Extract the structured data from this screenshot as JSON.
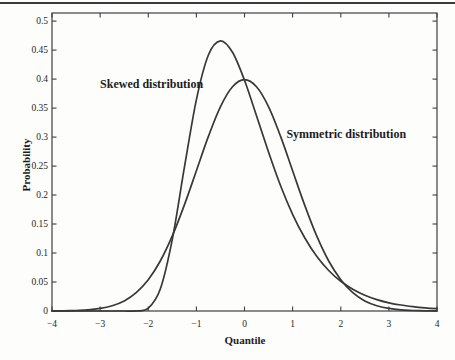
{
  "chart_data": {
    "type": "line",
    "title": "",
    "xlabel": "Quantile",
    "ylabel": "Probability",
    "xlim": [
      -4,
      4
    ],
    "ylim": [
      0,
      0.514
    ],
    "grid": false,
    "legend_position": "none",
    "x_ticks": [
      -4,
      -3,
      -2,
      -1,
      0,
      1,
      2,
      3,
      4
    ],
    "x_tick_labels": [
      "−4",
      "−3",
      "−2",
      "−1",
      "0",
      "1",
      "2",
      "3",
      "4"
    ],
    "y_ticks": [
      0,
      0.05,
      0.1,
      0.15,
      0.2,
      0.25,
      0.3,
      0.35,
      0.4,
      0.45,
      0.5
    ],
    "y_tick_labels": [
      "0",
      "0.05",
      "0.1",
      "0.15",
      "0.2",
      "0.25",
      "0.3",
      "0.35",
      "0.4",
      "0.45",
      "0.5"
    ],
    "x": [
      -4,
      -3.75,
      -3.5,
      -3.25,
      -3,
      -2.75,
      -2.5,
      -2.25,
      -2,
      -1.75,
      -1.5,
      -1.25,
      -1,
      -0.75,
      -0.5,
      -0.25,
      0,
      0.25,
      0.5,
      0.75,
      1,
      1.25,
      1.5,
      1.75,
      2,
      2.25,
      2.5,
      2.75,
      3,
      3.25,
      3.5,
      3.75,
      4
    ],
    "series": [
      {
        "name": "Skewed distribution",
        "values": [
          0,
          0,
          0,
          0,
          0,
          0,
          0,
          0.0001,
          0.0049,
          0.038,
          0.1236,
          0.2469,
          0.3647,
          0.4415,
          0.466,
          0.4462,
          0.3979,
          0.3367,
          0.2737,
          0.2159,
          0.1666,
          0.1262,
          0.0943,
          0.0698,
          0.0512,
          0.0374,
          0.0271,
          0.0196,
          0.0142,
          0.0103,
          0.0074,
          0.0053,
          0.0039
        ]
      },
      {
        "name": "Symmetric distribution",
        "values": [
          0.0001,
          0.0004,
          0.0009,
          0.002,
          0.0044,
          0.0091,
          0.0175,
          0.0317,
          0.054,
          0.0863,
          0.1295,
          0.1826,
          0.242,
          0.3011,
          0.3521,
          0.3867,
          0.3989,
          0.3867,
          0.3521,
          0.3011,
          0.242,
          0.1826,
          0.1295,
          0.0863,
          0.054,
          0.0317,
          0.0175,
          0.0091,
          0.0044,
          0.002,
          0.0009,
          0.0004,
          0.0001
        ]
      }
    ],
    "annotations": [
      {
        "label": "Skewed distribution",
        "x": -3.0,
        "y": 0.385
      },
      {
        "label": "Symmetric distribution",
        "x": 0.87,
        "y": 0.298
      }
    ],
    "colors": {
      "line": "#383838",
      "text": "#1f1f1f",
      "frame": "#3f3f3f",
      "background": "#fdfdfc",
      "top_rule": "#3a3a3a"
    }
  }
}
